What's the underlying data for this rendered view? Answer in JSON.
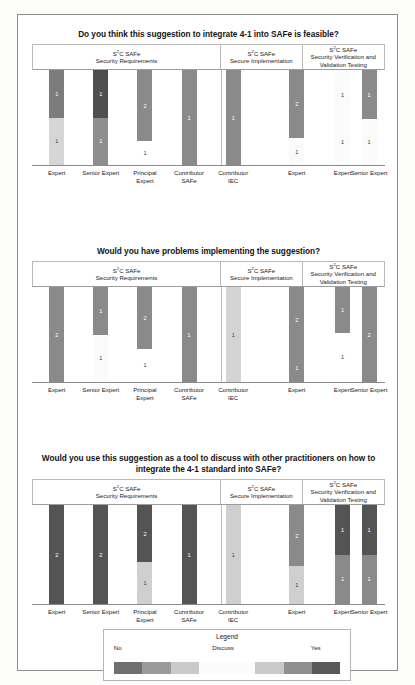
{
  "figure": {
    "legend": {
      "title": "Legend",
      "labels": [
        {
          "text": "No",
          "pos_pct": 4
        },
        {
          "text": "Discuss",
          "pos_pct": 44
        },
        {
          "text": "Yes",
          "pos_pct": 84
        }
      ],
      "colors": [
        "#6f6f6f",
        "#9a9a9a",
        "#c9c9c9",
        "#fbfbfb",
        "#fbfbfb",
        "#c9c9c9",
        "#8f8f8f",
        "#595959"
      ]
    }
  },
  "chart_data": [
    {
      "type": "bar",
      "stacked": true,
      "title": "Do you think this suggestion to integrate 4-1 into SAFe is feasible?",
      "xlabel": "",
      "ylabel": "",
      "groups": [
        {
          "line1": "S²C SAFe",
          "line2": "Security Requirements",
          "width_pct": 53.6
        },
        {
          "line1": "S²C SAFe",
          "line2": "Secure Implementation",
          "width_pct": 23.2
        },
        {
          "line1": "S²C SAFe",
          "line2": "Security Verification and Validation Testing",
          "width_pct": 23.2
        }
      ],
      "categories": [
        {
          "label": "Expert",
          "group": 0
        },
        {
          "label": "Senior Expert",
          "group": 0
        },
        {
          "label": "Principal Expert",
          "group": 0
        },
        {
          "label": "Contributor SAFe",
          "group": 0
        },
        {
          "label": "Contributor IEC",
          "group": 0
        },
        {
          "label": "Expert",
          "group": 1
        },
        {
          "label": "Expert",
          "group": 2
        },
        {
          "label": "Senior Expert",
          "group": 2
        }
      ],
      "bars": [
        {
          "x_pct": 7.0,
          "segments": [
            {
              "value": 1,
              "color": "#7c7c7c",
              "height_pct": 50
            },
            {
              "value": 1,
              "color": "#d6d6d6",
              "height_pct": 50
            }
          ]
        },
        {
          "x_pct": 19.5,
          "segments": [
            {
              "value": 1,
              "color": "#4f4f4f",
              "height_pct": 50
            },
            {
              "value": 1,
              "color": "#8e8e8e",
              "height_pct": 50
            }
          ]
        },
        {
          "x_pct": 32.0,
          "segments": [
            {
              "value": 2,
              "color": "#8a8a8a",
              "height_pct": 75
            },
            {
              "value": 1,
              "color": "#ffffff",
              "height_pct": 25
            }
          ]
        },
        {
          "x_pct": 44.5,
          "segments": [
            {
              "value": 1,
              "color": "#8a8a8a",
              "height_pct": 100
            }
          ]
        },
        {
          "x_pct": 57.0,
          "segments": [
            {
              "value": 1,
              "color": "#8a8a8a",
              "height_pct": 100
            }
          ]
        },
        {
          "x_pct": 75.0,
          "segments": [
            {
              "value": 2,
              "color": "#8a8a8a",
              "height_pct": 72
            },
            {
              "value": 1,
              "color": "#fafafa",
              "height_pct": 28
            }
          ]
        },
        {
          "x_pct": 88.0,
          "segments": [
            {
              "value": 1,
              "color": "#fbfbfb",
              "height_pct": 52
            },
            {
              "value": 1,
              "color": "#fbfbfb",
              "height_pct": 48
            }
          ]
        },
        {
          "x_pct": 95.5,
          "segments": [
            {
              "value": 1,
              "color": "#8a8a8a",
              "height_pct": 52
            },
            {
              "value": 1,
              "color": "#fbfbfb",
              "height_pct": 48
            }
          ]
        }
      ]
    },
    {
      "type": "bar",
      "stacked": true,
      "title": "Would you have problems implementing the suggestion?",
      "xlabel": "",
      "ylabel": "",
      "groups": [
        {
          "line1": "S²C SAFe",
          "line2": "Security Requirements",
          "width_pct": 53.6
        },
        {
          "line1": "S²C SAFe",
          "line2": "Secure Implementation",
          "width_pct": 23.2
        },
        {
          "line1": "S²C SAFe",
          "line2": "Security Verification and Validation Testing",
          "width_pct": 23.2
        }
      ],
      "categories": [
        {
          "label": "Expert",
          "group": 0
        },
        {
          "label": "Senior Expert",
          "group": 0
        },
        {
          "label": "Principal Expert",
          "group": 0
        },
        {
          "label": "Contributor SAFe",
          "group": 0
        },
        {
          "label": "Contributor IEC",
          "group": 0
        },
        {
          "label": "Expert",
          "group": 1
        },
        {
          "label": "Expert",
          "group": 2
        },
        {
          "label": "Senior Expert",
          "group": 2
        }
      ],
      "bars": [
        {
          "x_pct": 7.0,
          "segments": [
            {
              "value": 2,
              "color": "#8a8a8a",
              "height_pct": 100
            }
          ]
        },
        {
          "x_pct": 19.5,
          "segments": [
            {
              "value": 1,
              "color": "#8a8a8a",
              "height_pct": 50
            },
            {
              "value": 1,
              "color": "#fbfbfb",
              "height_pct": 50
            }
          ]
        },
        {
          "x_pct": 32.0,
          "segments": [
            {
              "value": 2,
              "color": "#8a8a8a",
              "height_pct": 65
            },
            {
              "value": 1,
              "color": "#ffffff",
              "height_pct": 35
            }
          ]
        },
        {
          "x_pct": 44.5,
          "segments": [
            {
              "value": 1,
              "color": "#8a8a8a",
              "height_pct": 100
            }
          ]
        },
        {
          "x_pct": 57.0,
          "segments": [
            {
              "value": 1,
              "color": "#d4d4d4",
              "height_pct": 100
            }
          ]
        },
        {
          "x_pct": 75.0,
          "segments": [
            {
              "value": 2,
              "color": "#8a8a8a",
              "height_pct": 70
            },
            {
              "value": 1,
              "color": "#8a8a8a",
              "height_pct": 30
            }
          ]
        },
        {
          "x_pct": 88.0,
          "segments": [
            {
              "value": 1,
              "color": "#8a8a8a",
              "height_pct": 48
            },
            {
              "value": 1,
              "color": "#ffffff",
              "height_pct": 52
            }
          ]
        },
        {
          "x_pct": 95.5,
          "segments": [
            {
              "value": 2,
              "color": "#8a8a8a",
              "height_pct": 100
            }
          ]
        }
      ]
    },
    {
      "type": "bar",
      "stacked": true,
      "title": "Would you use this suggestion as a tool to discuss with other practitioners on how to integrate the 4-1 standard into SAFe?",
      "xlabel": "",
      "ylabel": "",
      "groups": [
        {
          "line1": "S²C SAFe",
          "line2": "Security Requirements",
          "width_pct": 53.6
        },
        {
          "line1": "S²C SAFe",
          "line2": "Secure Implementation",
          "width_pct": 23.2
        },
        {
          "line1": "S²C SAFe",
          "line2": "Security Verification and Validation Testing",
          "width_pct": 23.2
        }
      ],
      "categories": [
        {
          "label": "Expert",
          "group": 0
        },
        {
          "label": "Senior Expert",
          "group": 0
        },
        {
          "label": "Principal Expert",
          "group": 0
        },
        {
          "label": "Contributor SAFe",
          "group": 0
        },
        {
          "label": "Contributor IEC",
          "group": 0
        },
        {
          "label": "Expert",
          "group": 1
        },
        {
          "label": "Expert",
          "group": 2
        },
        {
          "label": "Senior Expert",
          "group": 2
        }
      ],
      "bars": [
        {
          "x_pct": 7.0,
          "segments": [
            {
              "value": 2,
              "color": "#545454",
              "height_pct": 100
            }
          ]
        },
        {
          "x_pct": 19.5,
          "segments": [
            {
              "value": 2,
              "color": "#545454",
              "height_pct": 100
            }
          ]
        },
        {
          "x_pct": 32.0,
          "segments": [
            {
              "value": 2,
              "color": "#545454",
              "height_pct": 58
            },
            {
              "value": 1,
              "color": "#cfcfcf",
              "height_pct": 42
            }
          ]
        },
        {
          "x_pct": 44.5,
          "segments": [
            {
              "value": 1,
              "color": "#545454",
              "height_pct": 100
            }
          ]
        },
        {
          "x_pct": 57.0,
          "segments": [
            {
              "value": 1,
              "color": "#cfcfcf",
              "height_pct": 100
            }
          ]
        },
        {
          "x_pct": 75.0,
          "segments": [
            {
              "value": 2,
              "color": "#8a8a8a",
              "height_pct": 62
            },
            {
              "value": 1,
              "color": "#cfcfcf",
              "height_pct": 38
            }
          ]
        },
        {
          "x_pct": 88.0,
          "segments": [
            {
              "value": 1,
              "color": "#545454",
              "height_pct": 50
            },
            {
              "value": 1,
              "color": "#8a8a8a",
              "height_pct": 50
            }
          ]
        },
        {
          "x_pct": 95.5,
          "segments": [
            {
              "value": 1,
              "color": "#545454",
              "height_pct": 50
            },
            {
              "value": 1,
              "color": "#8a8a8a",
              "height_pct": 50
            }
          ]
        }
      ]
    }
  ]
}
